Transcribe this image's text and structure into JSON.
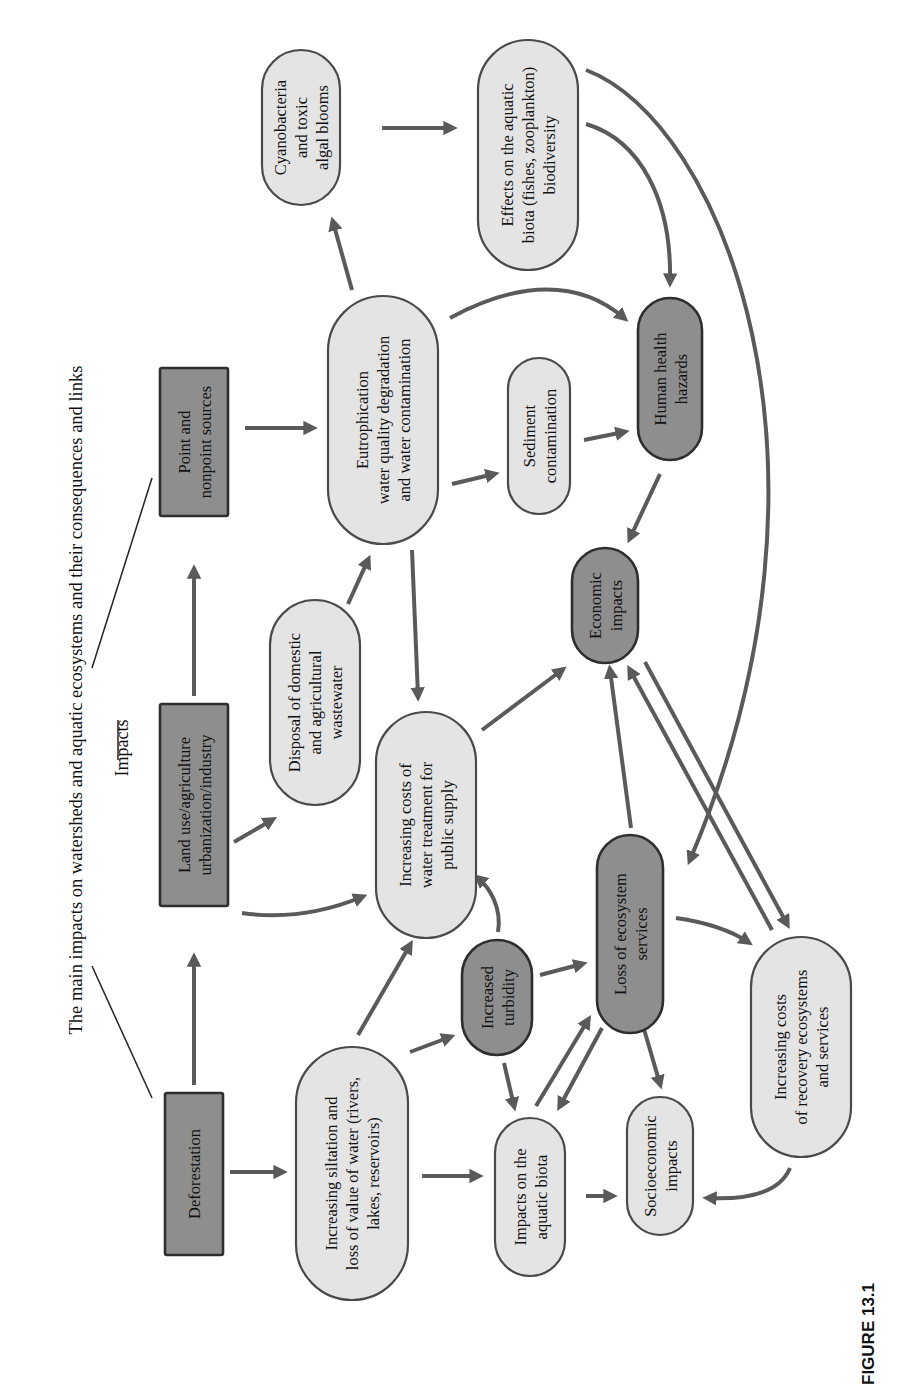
{
  "title": "The main impacts on watersheds and aquatic ecosystems and their consequences and links",
  "impacts_label": "Impacts",
  "figure_caption": "FIGURE 13.1",
  "colors": {
    "light_fill": "#e4e4e4",
    "dark_fill": "#8e8e8e",
    "arrow": "#5a5a5a",
    "text": "#111111"
  },
  "nodes": [
    {
      "id": "point_sources",
      "shape": "rect",
      "style": "dark",
      "x": 160,
      "y": 368,
      "w": 68,
      "h": 148,
      "lines": [
        "Point and",
        "nonpoint sources"
      ]
    },
    {
      "id": "land_use",
      "shape": "rect",
      "style": "dark",
      "x": 160,
      "y": 704,
      "w": 68,
      "h": 202,
      "lines": [
        "Land use/agriculture",
        "urbanization/industry"
      ]
    },
    {
      "id": "deforestation",
      "shape": "rect",
      "style": "dark",
      "x": 165,
      "y": 1093,
      "w": 58,
      "h": 162,
      "lines": [
        "Deforestation"
      ]
    },
    {
      "id": "cyanobacteria",
      "shape": "pill",
      "style": "light",
      "x": 262,
      "y": 50,
      "w": 78,
      "h": 155,
      "lines": [
        "Cyanobacteria",
        "and toxic",
        "algal blooms"
      ]
    },
    {
      "id": "effects_biota",
      "shape": "pill",
      "style": "light",
      "x": 478,
      "y": 40,
      "w": 100,
      "h": 230,
      "lines": [
        "Effects on the aquatic",
        "biota (fishes, zooplankton)",
        "biodiversity"
      ]
    },
    {
      "id": "eutrophication",
      "shape": "pill",
      "style": "light",
      "x": 328,
      "y": 296,
      "w": 110,
      "h": 248,
      "lines": [
        "Eutrophication",
        "water quality degradation",
        "and water contamination"
      ]
    },
    {
      "id": "sediment",
      "shape": "pill",
      "style": "light",
      "x": 508,
      "y": 358,
      "w": 62,
      "h": 156,
      "lines": [
        "Sediment",
        "contamination"
      ]
    },
    {
      "id": "human_health",
      "shape": "pill",
      "style": "dark",
      "x": 638,
      "y": 298,
      "w": 64,
      "h": 162,
      "lines": [
        "Human health",
        "hazards"
      ]
    },
    {
      "id": "economic",
      "shape": "pill",
      "style": "dark",
      "x": 572,
      "y": 548,
      "w": 66,
      "h": 115,
      "lines": [
        "Economic",
        "impacts"
      ]
    },
    {
      "id": "disposal",
      "shape": "pill",
      "style": "light",
      "x": 270,
      "y": 600,
      "w": 90,
      "h": 205,
      "lines": [
        "Disposal of domestic",
        "and agricultural",
        "wastewater"
      ]
    },
    {
      "id": "water_treatment",
      "shape": "pill",
      "style": "light",
      "x": 376,
      "y": 712,
      "w": 100,
      "h": 226,
      "lines": [
        "Increasing costs of",
        "water treatment for",
        "public supply"
      ]
    },
    {
      "id": "siltation",
      "shape": "pill",
      "style": "light",
      "x": 296,
      "y": 1047,
      "w": 112,
      "h": 253,
      "lines": [
        "Increasing siltation and",
        "loss of value of water (rivers,",
        "lakes, reservoirs)"
      ]
    },
    {
      "id": "turbidity",
      "shape": "pill",
      "style": "dark",
      "x": 462,
      "y": 940,
      "w": 70,
      "h": 115,
      "lines": [
        "Increased",
        "turbidity"
      ]
    },
    {
      "id": "loss_ecosystem",
      "shape": "pill",
      "style": "dark",
      "x": 597,
      "y": 835,
      "w": 66,
      "h": 198,
      "lines": [
        "Loss of ecosystem",
        "services"
      ]
    },
    {
      "id": "impacts_biota",
      "shape": "pill",
      "style": "light",
      "x": 495,
      "y": 1118,
      "w": 70,
      "h": 158,
      "lines": [
        "Impacts on the",
        "aquatic biota"
      ]
    },
    {
      "id": "socioeconomic",
      "shape": "pill",
      "style": "light",
      "x": 627,
      "y": 1097,
      "w": 66,
      "h": 138,
      "lines": [
        "Socioeconomic",
        "impacts"
      ]
    },
    {
      "id": "recovery_costs",
      "shape": "pill",
      "style": "light",
      "x": 751,
      "y": 937,
      "w": 100,
      "h": 220,
      "lines": [
        "Increasing costs",
        "of recovery ecosystems",
        "and services"
      ]
    }
  ],
  "edges": [
    {
      "from": "deforestation",
      "to": "land_use",
      "d": "M194 1085 L194 958"
    },
    {
      "from": "land_use",
      "to": "point_sources",
      "d": "M194 696 L194 570"
    },
    {
      "from": "point_sources",
      "to": "eutrophication",
      "d": "M245 428 L312 428"
    },
    {
      "from": "eutrophication",
      "to": "cyanobacteria",
      "d": "M352 290 L333 222"
    },
    {
      "from": "cyanobacteria",
      "to": "effects_biota",
      "d": "M382 128 L452 128"
    },
    {
      "from": "effects_biota",
      "to": "human_health",
      "d": "M586 124 C640 140 672 200 670 282"
    },
    {
      "from": "effects_biota",
      "to": "loss_ecosystem",
      "d": "M586 70 C720 120 860 460 690 860"
    },
    {
      "from": "eutrophication",
      "to": "human_health",
      "d": "M450 318 C520 280 580 280 624 318"
    },
    {
      "from": "eutrophication",
      "to": "sediment",
      "d": "M452 484 L494 474"
    },
    {
      "from": "sediment",
      "to": "human_health",
      "d": "M584 440 L624 432"
    },
    {
      "from": "human_health",
      "to": "economic",
      "d": "M660 474 L630 538"
    },
    {
      "from": "eutrophication",
      "to": "water_treatment",
      "d": "M412 550 L418 696"
    },
    {
      "from": "disposal",
      "to": "eutrophication",
      "d": "M348 604 L368 560"
    },
    {
      "from": "land_use",
      "to": "disposal",
      "d": "M234 842 L272 820"
    },
    {
      "from": "land_use",
      "to": "water_treatment",
      "d": "M242 913 C290 920 330 910 362 897"
    },
    {
      "from": "water_treatment",
      "to": "economic",
      "d": "M482 730 L562 670"
    },
    {
      "from": "deforestation",
      "to": "siltation",
      "d": "M230 1172 L282 1172"
    },
    {
      "from": "siltation",
      "to": "water_treatment",
      "d": "M358 1035 L410 945"
    },
    {
      "from": "siltation",
      "to": "turbidity",
      "d": "M410 1052 L450 1037"
    },
    {
      "from": "siltation",
      "to": "impacts_biota",
      "d": "M422 1176 L478 1176"
    },
    {
      "from": "turbidity",
      "to": "water_treatment",
      "d": "M498 932 C502 908 490 888 478 878"
    },
    {
      "from": "turbidity",
      "to": "loss_ecosystem",
      "d": "M540 975 L582 964"
    },
    {
      "from": "turbidity",
      "to": "impacts_biota",
      "d": "M504 1063 L514 1106"
    },
    {
      "from": "impacts_biota",
      "to": "loss_ecosystem",
      "d": "M536 1106 L588 1020"
    },
    {
      "from": "loss_ecosystem",
      "to": "impacts_biota",
      "d": "M602 1028 L560 1106"
    },
    {
      "from": "impacts_biota",
      "to": "socioeconomic",
      "d": "M586 1196 L612 1196"
    },
    {
      "from": "loss_ecosystem",
      "to": "socioeconomic",
      "d": "M641 1019 L660 1084"
    },
    {
      "from": "loss_ecosystem",
      "to": "economic",
      "d": "M631 828 L610 670"
    },
    {
      "from": "economic",
      "to": "recovery_costs",
      "d": "M645 662 L787 924"
    },
    {
      "from": "recovery_costs",
      "to": "economic",
      "d": "M772 930 L630 670"
    },
    {
      "from": "loss_ecosystem",
      "to": "recovery_costs",
      "d": "M676 918 C704 922 730 930 748 942"
    },
    {
      "from": "recovery_costs",
      "to": "socioeconomic",
      "d": "M790 1168 C780 1192 750 1200 708 1198"
    }
  ],
  "connector_lines": [
    {
      "d": "M152 1098 L92 966"
    },
    {
      "d": "M118 720 L118 760"
    },
    {
      "d": "M92 668 L152 478"
    }
  ]
}
